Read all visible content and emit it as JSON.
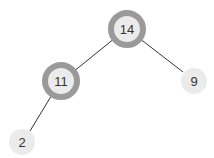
{
  "tree": {
    "nodes": [
      {
        "id": "n14",
        "label": "14",
        "x": 127,
        "y": 29,
        "highlighted": true
      },
      {
        "id": "n11",
        "label": "11",
        "x": 61,
        "y": 81,
        "highlighted": true
      },
      {
        "id": "n9",
        "label": "9",
        "x": 194,
        "y": 81,
        "highlighted": false
      },
      {
        "id": "n2",
        "label": "2",
        "x": 22,
        "y": 142,
        "highlighted": false
      }
    ],
    "edges": [
      {
        "from": "14",
        "to": "11"
      },
      {
        "from": "14",
        "to": "9"
      },
      {
        "from": "11",
        "to": "2"
      }
    ]
  },
  "colors": {
    "ring": "#9a9a9a",
    "node_fill": "#ebebeb",
    "edge": "#333333",
    "text": "#333333"
  }
}
